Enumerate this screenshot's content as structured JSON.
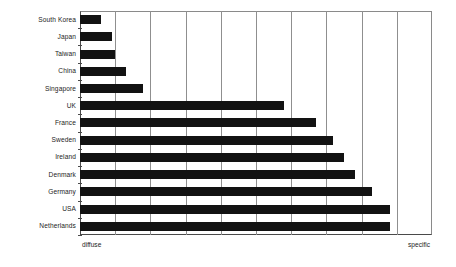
{
  "chart_data": {
    "type": "bar",
    "orientation": "horizontal",
    "title": "",
    "subtitle": "",
    "xlabel": "",
    "ylabel": "",
    "xlim": [
      0,
      10
    ],
    "x_axis_left_label": "diffuse",
    "x_axis_right_label": "specific",
    "grid": true,
    "gridlines": [
      1,
      2,
      3,
      4,
      5,
      6,
      7,
      8,
      9
    ],
    "legend": null,
    "categories": [
      "South Korea",
      "Japan",
      "Taiwan",
      "China",
      "Singapore",
      "UK",
      "France",
      "Sweden",
      "Ireland",
      "Denmark",
      "Germany",
      "USA",
      "Netherlands"
    ],
    "values": [
      0.6,
      0.9,
      1.0,
      1.3,
      1.8,
      5.8,
      6.7,
      7.2,
      7.5,
      7.8,
      8.3,
      8.8,
      8.8
    ],
    "bar_color": "#121212",
    "grid_color": "#8f8f8f",
    "axis_color": "#4a4a4a"
  }
}
